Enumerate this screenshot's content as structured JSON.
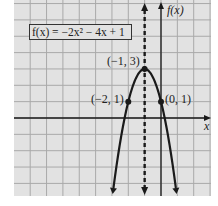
{
  "chart_data": {
    "type": "line",
    "title": "",
    "equation": "f(x) = -2x^2 - 4x + 1",
    "equation_label": "f(x) = −2x² − 4x + 1",
    "xlabel": "x",
    "ylabel": "f(x)",
    "xlim": [
      -9,
      3
    ],
    "ylim": [
      -5,
      7
    ],
    "grid": true,
    "grid_step": 1,
    "axis_of_symmetry": {
      "x": -1,
      "style": "dashed"
    },
    "series": [
      {
        "name": "f(x) = -2x^2 - 4x + 1",
        "function": "-2x^2-4x+1",
        "domain": [
          -3.0,
          1.0
        ]
      }
    ],
    "points": [
      {
        "x": -1,
        "y": 3,
        "label": "(−1, 3)",
        "role": "vertex"
      },
      {
        "x": -2,
        "y": 1,
        "label": "(−2, 1)"
      },
      {
        "x": 0,
        "y": 1,
        "label": "(0, 1)"
      }
    ]
  },
  "colors": {
    "background": "#e2e2e2",
    "grid": "#a9a9a9",
    "curve": "#1a1a1a",
    "axis": "#1a1a1a"
  }
}
